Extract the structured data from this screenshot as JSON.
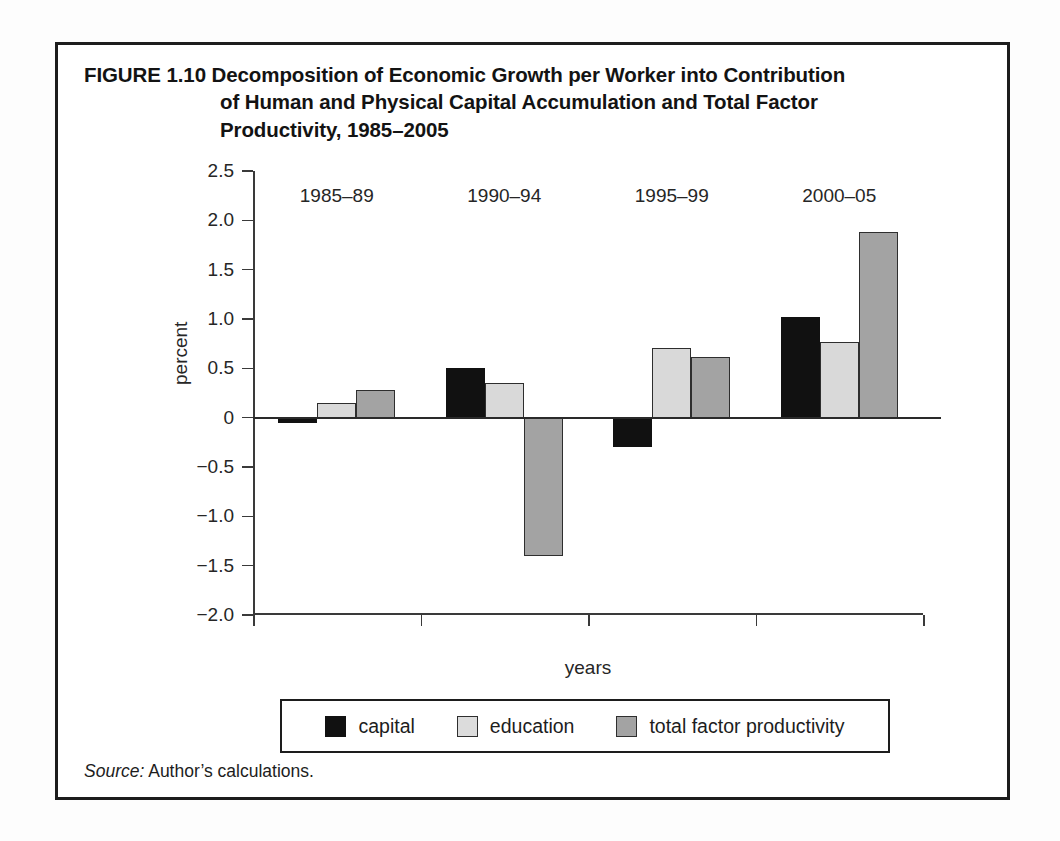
{
  "figure": {
    "number_label": "FIGURE 1.10",
    "title_line_1": "Decomposition of Economic Growth per Worker into Contribution",
    "title_line_2": "of Human and Physical Capital Accumulation and Total Factor",
    "title_line_3": "Productivity, 1985–2005",
    "source_keyword": "Source:",
    "source_text": "Author’s calculations."
  },
  "chart_data": {
    "type": "bar",
    "title": "FIGURE 1.10 Decomposition of Economic Growth per Worker into Contribution of Human and Physical Capital Accumulation and Total Factor Productivity, 1985–2005",
    "xlabel": "years",
    "ylabel": "percent",
    "categories": [
      "1985–89",
      "1990–94",
      "1995–99",
      "2000–05"
    ],
    "series": [
      {
        "name": "capital",
        "color": "#111111",
        "values": [
          -0.05,
          0.5,
          -0.3,
          1.02
        ]
      },
      {
        "name": "education",
        "color": "#d9d9d9",
        "values": [
          0.15,
          0.35,
          0.71,
          0.77
        ]
      },
      {
        "name": "total factor productivity",
        "color": "#a3a3a3",
        "values": [
          0.28,
          -1.4,
          0.61,
          1.88
        ]
      }
    ],
    "ylim": [
      -2.0,
      2.5
    ],
    "ytick_values": [
      2.5,
      2.0,
      1.5,
      1.0,
      0.5,
      0,
      -0.5,
      -1.0,
      -1.5,
      -2.0
    ],
    "ytick_labels": [
      "2.5",
      "2.0",
      "1.5",
      "1.0",
      "0.5",
      "0",
      "−0.5",
      "−1.0",
      "−1.5",
      "−2.0"
    ],
    "grid": false,
    "legend_position": "bottom",
    "legend_entries": [
      "capital",
      "education",
      "total factor productivity"
    ]
  }
}
